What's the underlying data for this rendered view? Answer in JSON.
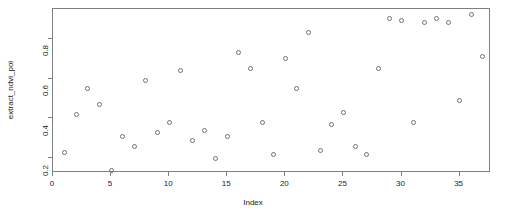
{
  "chart_data": {
    "type": "scatter",
    "title": "",
    "xlabel": "Index",
    "ylabel": "extract_ndvi_poi",
    "xlim": [
      0.0,
      37.7
    ],
    "ylim": [
      0.125,
      0.95
    ],
    "grid": false,
    "legend": null,
    "point_symbol": "open-circle",
    "point_color": "#707070",
    "xticks": [
      0,
      5,
      10,
      15,
      20,
      25,
      30,
      35
    ],
    "xticklabels": [
      "0",
      "5",
      "10",
      "15",
      "20",
      "25",
      "30",
      "35"
    ],
    "yticks": [
      0.2,
      0.4,
      0.6,
      0.8
    ],
    "yticklabels": [
      "0.2",
      "0.4",
      "0.6",
      "0.8"
    ],
    "x": [
      1,
      2,
      3,
      4,
      5,
      6,
      7,
      8,
      9,
      10,
      11,
      12,
      13,
      14,
      15,
      16,
      17,
      18,
      19,
      20,
      21,
      22,
      23,
      24,
      25,
      26,
      27,
      28,
      29,
      30,
      31,
      32,
      33,
      34,
      35,
      36,
      37
    ],
    "y": [
      0.23,
      0.42,
      0.55,
      0.47,
      0.14,
      0.31,
      0.26,
      0.59,
      0.33,
      0.38,
      0.64,
      0.29,
      0.34,
      0.2,
      0.31,
      0.73,
      0.65,
      0.38,
      0.22,
      0.7,
      0.55,
      0.83,
      0.24,
      0.37,
      0.43,
      0.26,
      0.22,
      0.65,
      0.9,
      0.89,
      0.38,
      0.88,
      0.9,
      0.88,
      0.49,
      0.92,
      0.71
    ],
    "points": [
      {
        "index": 1,
        "value": 0.23
      },
      {
        "index": 2,
        "value": 0.42
      },
      {
        "index": 3,
        "value": 0.55
      },
      {
        "index": 4,
        "value": 0.47
      },
      {
        "index": 5,
        "value": 0.14
      },
      {
        "index": 6,
        "value": 0.31
      },
      {
        "index": 7,
        "value": 0.26
      },
      {
        "index": 8,
        "value": 0.59
      },
      {
        "index": 9,
        "value": 0.33
      },
      {
        "index": 10,
        "value": 0.38
      },
      {
        "index": 11,
        "value": 0.64
      },
      {
        "index": 12,
        "value": 0.29
      },
      {
        "index": 13,
        "value": 0.34
      },
      {
        "index": 14,
        "value": 0.2
      },
      {
        "index": 15,
        "value": 0.31
      },
      {
        "index": 16,
        "value": 0.73
      },
      {
        "index": 17,
        "value": 0.65
      },
      {
        "index": 18,
        "value": 0.38
      },
      {
        "index": 19,
        "value": 0.22
      },
      {
        "index": 20,
        "value": 0.7
      },
      {
        "index": 21,
        "value": 0.55
      },
      {
        "index": 22,
        "value": 0.83
      },
      {
        "index": 23,
        "value": 0.24
      },
      {
        "index": 24,
        "value": 0.37
      },
      {
        "index": 25,
        "value": 0.43
      },
      {
        "index": 26,
        "value": 0.26
      },
      {
        "index": 27,
        "value": 0.22
      },
      {
        "index": 28,
        "value": 0.65
      },
      {
        "index": 29,
        "value": 0.9
      },
      {
        "index": 30,
        "value": 0.89
      },
      {
        "index": 31,
        "value": 0.38
      },
      {
        "index": 32,
        "value": 0.88
      },
      {
        "index": 33,
        "value": 0.9
      },
      {
        "index": 34,
        "value": 0.88
      },
      {
        "index": 35,
        "value": 0.49
      },
      {
        "index": 36,
        "value": 0.92
      },
      {
        "index": 37,
        "value": 0.71
      }
    ]
  }
}
